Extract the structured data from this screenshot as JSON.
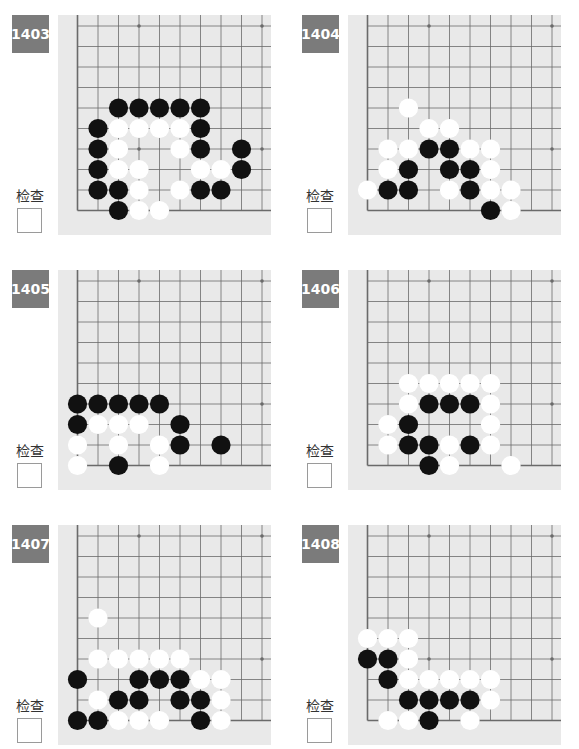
{
  "page": {
    "check_label": "检查",
    "colors": {
      "badge_bg": "#7b7b7b",
      "board_bg": "#e9e9e9",
      "grid_line": "#6a6a6a",
      "black_stone": "#111111",
      "white_stone": "#ffffff"
    }
  },
  "board_layout": {
    "cols": 10,
    "rows": 10,
    "spacing": 20.5,
    "origin_x": 19.5,
    "origin_y": 11,
    "open_edges": [
      "top",
      "right"
    ],
    "star_points": [
      [
        3,
        0
      ],
      [
        9,
        0
      ],
      [
        3,
        6
      ],
      [
        9,
        6
      ]
    ]
  },
  "problems": [
    {
      "number": "1403",
      "black": [
        [
          2,
          4
        ],
        [
          3,
          4
        ],
        [
          4,
          4
        ],
        [
          5,
          4
        ],
        [
          6,
          4
        ],
        [
          1,
          5
        ],
        [
          6,
          5
        ],
        [
          1,
          6
        ],
        [
          6,
          6
        ],
        [
          8,
          6
        ],
        [
          1,
          7
        ],
        [
          8,
          7
        ],
        [
          1,
          8
        ],
        [
          2,
          8
        ],
        [
          6,
          8
        ],
        [
          7,
          8
        ],
        [
          2,
          9
        ]
      ],
      "white": [
        [
          2,
          5
        ],
        [
          3,
          5
        ],
        [
          4,
          5
        ],
        [
          5,
          5
        ],
        [
          2,
          6
        ],
        [
          5,
          6
        ],
        [
          2,
          7
        ],
        [
          3,
          7
        ],
        [
          6,
          7
        ],
        [
          7,
          7
        ],
        [
          3,
          8
        ],
        [
          5,
          8
        ],
        [
          3,
          9
        ],
        [
          4,
          9
        ]
      ]
    },
    {
      "number": "1404",
      "black": [
        [
          3,
          6
        ],
        [
          4,
          6
        ],
        [
          2,
          7
        ],
        [
          4,
          7
        ],
        [
          5,
          7
        ],
        [
          1,
          8
        ],
        [
          2,
          8
        ],
        [
          5,
          8
        ],
        [
          6,
          9
        ]
      ],
      "white": [
        [
          2,
          4
        ],
        [
          3,
          5
        ],
        [
          4,
          5
        ],
        [
          1,
          6
        ],
        [
          2,
          6
        ],
        [
          5,
          6
        ],
        [
          6,
          6
        ],
        [
          1,
          7
        ],
        [
          6,
          7
        ],
        [
          0,
          8
        ],
        [
          4,
          8
        ],
        [
          6,
          8
        ],
        [
          7,
          8
        ],
        [
          7,
          9
        ]
      ]
    },
    {
      "number": "1405",
      "black": [
        [
          0,
          6
        ],
        [
          1,
          6
        ],
        [
          2,
          6
        ],
        [
          3,
          6
        ],
        [
          4,
          6
        ],
        [
          0,
          7
        ],
        [
          5,
          7
        ],
        [
          5,
          8
        ],
        [
          7,
          8
        ],
        [
          2,
          9
        ]
      ],
      "white": [
        [
          1,
          7
        ],
        [
          2,
          7
        ],
        [
          3,
          7
        ],
        [
          0,
          8
        ],
        [
          2,
          8
        ],
        [
          4,
          8
        ],
        [
          0,
          9
        ],
        [
          4,
          9
        ]
      ]
    },
    {
      "number": "1406",
      "black": [
        [
          3,
          6
        ],
        [
          4,
          6
        ],
        [
          5,
          6
        ],
        [
          2,
          7
        ],
        [
          2,
          8
        ],
        [
          3,
          8
        ],
        [
          5,
          8
        ],
        [
          3,
          9
        ]
      ],
      "white": [
        [
          2,
          5
        ],
        [
          3,
          5
        ],
        [
          4,
          5
        ],
        [
          5,
          5
        ],
        [
          6,
          5
        ],
        [
          2,
          6
        ],
        [
          6,
          6
        ],
        [
          1,
          7
        ],
        [
          6,
          7
        ],
        [
          1,
          8
        ],
        [
          4,
          8
        ],
        [
          6,
          8
        ],
        [
          4,
          9
        ],
        [
          7,
          9
        ]
      ]
    },
    {
      "number": "1407",
      "black": [
        [
          0,
          7
        ],
        [
          3,
          7
        ],
        [
          4,
          7
        ],
        [
          5,
          7
        ],
        [
          2,
          8
        ],
        [
          3,
          8
        ],
        [
          5,
          8
        ],
        [
          6,
          8
        ],
        [
          0,
          9
        ],
        [
          1,
          9
        ],
        [
          6,
          9
        ]
      ],
      "white": [
        [
          1,
          4
        ],
        [
          1,
          6
        ],
        [
          2,
          6
        ],
        [
          3,
          6
        ],
        [
          4,
          6
        ],
        [
          5,
          6
        ],
        [
          6,
          7
        ],
        [
          7,
          7
        ],
        [
          1,
          8
        ],
        [
          7,
          8
        ],
        [
          2,
          9
        ],
        [
          3,
          9
        ],
        [
          4,
          9
        ],
        [
          7,
          9
        ]
      ]
    },
    {
      "number": "1408",
      "black": [
        [
          0,
          6
        ],
        [
          1,
          6
        ],
        [
          1,
          7
        ],
        [
          2,
          8
        ],
        [
          3,
          8
        ],
        [
          4,
          8
        ],
        [
          5,
          8
        ],
        [
          3,
          9
        ]
      ],
      "white": [
        [
          0,
          5
        ],
        [
          1,
          5
        ],
        [
          2,
          5
        ],
        [
          2,
          6
        ],
        [
          2,
          7
        ],
        [
          3,
          7
        ],
        [
          4,
          7
        ],
        [
          5,
          7
        ],
        [
          6,
          7
        ],
        [
          6,
          8
        ],
        [
          1,
          9
        ],
        [
          2,
          9
        ],
        [
          5,
          9
        ]
      ]
    }
  ]
}
